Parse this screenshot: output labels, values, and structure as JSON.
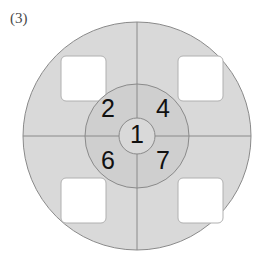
{
  "figure": {
    "label": "(3)"
  },
  "diagram": {
    "name": "concentric-target-diagram",
    "center": {
      "cx": 137,
      "cy": 136
    },
    "rings": {
      "outer_radius": 114,
      "middle_radius": 52,
      "center_radius": 18
    },
    "colors": {
      "outer_ring_fill": "#d9d9d9",
      "middle_ring_fill": "#cfcfcf",
      "center_fill": "#d9d9d9",
      "stroke": "#8a8a8a",
      "square_fill": "#ffffff",
      "square_stroke": "#b0b0b0",
      "background": "#ffffff",
      "digit_color": "#111111",
      "label_color": "#4a4a4a"
    },
    "center_value": "1",
    "quadrants": [
      {
        "position": "top-left",
        "value": "2"
      },
      {
        "position": "top-right",
        "value": "4"
      },
      {
        "position": "bottom-left",
        "value": "6"
      },
      {
        "position": "bottom-right",
        "value": "7"
      }
    ],
    "squares": [
      {
        "position": "top-left",
        "x": 61,
        "y": 56,
        "w": 45,
        "h": 45
      },
      {
        "position": "top-right",
        "x": 178,
        "y": 56,
        "w": 45,
        "h": 45
      },
      {
        "position": "bottom-left",
        "x": 61,
        "y": 178,
        "w": 45,
        "h": 45
      },
      {
        "position": "bottom-right",
        "x": 178,
        "y": 178,
        "w": 45,
        "h": 45
      }
    ],
    "divider_lines": {
      "vertical": {
        "x": 137,
        "y1": 22,
        "y2": 250
      },
      "horizontal": {
        "y": 136,
        "x1": 23,
        "x2": 251
      }
    }
  }
}
